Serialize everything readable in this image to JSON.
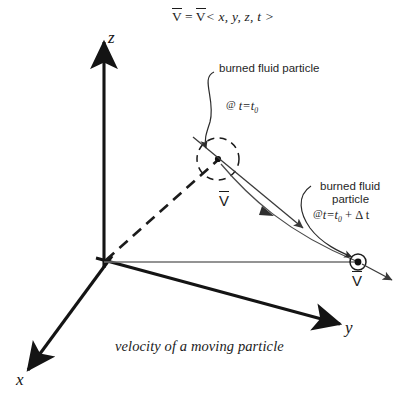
{
  "figure": {
    "caption": "velocity of a moving particle",
    "equation": {
      "lhs": "V",
      "equals": "=",
      "rhs": "V",
      "arguments": "< x, y, z, t >"
    },
    "axes": [
      {
        "name": "z-axis",
        "label": "z",
        "direction": "up"
      },
      {
        "name": "y-axis",
        "label": "y",
        "direction": "down-right"
      },
      {
        "name": "x-axis",
        "label": "x",
        "direction": "down-left"
      }
    ],
    "annotations": [
      {
        "id": "particle-initial",
        "title": "burned fluid particle",
        "title_lines": [
          "burned fluid particle"
        ],
        "time_at": "@",
        "time_expr": "t=t",
        "time_sub": "0",
        "time_extra": ""
      },
      {
        "id": "particle-later",
        "title": "burned fluid particle",
        "title_lines": [
          "burned fluid",
          "particle"
        ],
        "time_at": "@",
        "time_expr": "t=t",
        "time_sub": "0",
        "time_extra": " + Δ t"
      }
    ],
    "vectors": [
      {
        "id": "velocity-initial",
        "label": "V"
      },
      {
        "id": "velocity-later",
        "label": "V"
      }
    ],
    "colors": {
      "ink": "#1b1b1b",
      "axis": "#141414",
      "thin": "#4a4a4a",
      "gray": "#6f6f6f",
      "background": "#ffffff"
    }
  }
}
